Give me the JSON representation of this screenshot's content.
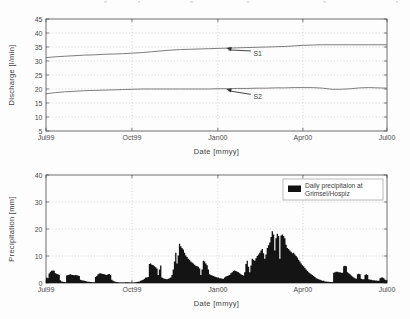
{
  "figure": {
    "title": "",
    "background": "#fdfdfd",
    "panels": [
      "discharge",
      "precipitation"
    ]
  },
  "colors": {
    "axis": "#4a4a4a",
    "grid": "#b9b9b9",
    "series": "#6e6e6e",
    "bars": "#141414",
    "text": "#3f3f3f",
    "background": "#fdfdfd"
  },
  "chart_data": [
    {
      "id": "discharge",
      "type": "line",
      "title": "",
      "xlabel": "Date  [mmyy]",
      "ylabel": "Discharge  [l/min]",
      "xlim": [
        0,
        365
      ],
      "ylim": [
        5,
        45
      ],
      "yticks": [
        5,
        10,
        15,
        20,
        25,
        30,
        35,
        40,
        45
      ],
      "ytick_labels": [
        "5",
        "10",
        "15",
        "20",
        "25",
        "30",
        "35",
        "40",
        "45"
      ],
      "xticks": [
        0,
        92,
        184,
        275,
        365
      ],
      "xtick_labels": [
        "Jul99",
        "Oct99",
        "Jan00",
        "Apr00",
        "Jul00"
      ],
      "grid": true,
      "grid_style": "dotted",
      "legend": "none",
      "annotations": [
        {
          "text": "S1",
          "x": 222,
          "y": 32.8,
          "points_to_x": 193,
          "points_to_y": 34.6
        },
        {
          "text": "S2",
          "x": 222,
          "y": 17.3,
          "points_to_x": 193,
          "points_to_y": 20.0
        }
      ],
      "series": [
        {
          "name": "S1",
          "x": [
            0,
            10,
            20,
            31,
            41,
            52,
            62,
            72,
            82,
            92,
            103,
            113,
            123,
            134,
            144,
            155,
            165,
            175,
            184,
            195,
            205,
            215,
            226,
            236,
            246,
            256,
            266,
            275,
            285,
            296,
            306,
            316,
            326,
            336,
            345,
            355,
            365
          ],
          "y": [
            31.2,
            31.5,
            31.7,
            31.9,
            32.1,
            32.2,
            32.4,
            32.5,
            32.6,
            32.8,
            33.0,
            33.3,
            33.6,
            33.9,
            34.1,
            34.2,
            34.3,
            34.4,
            34.5,
            34.6,
            34.7,
            34.8,
            34.9,
            35.0,
            35.1,
            35.2,
            35.4,
            35.6,
            35.7,
            35.8,
            35.8,
            35.8,
            35.8,
            35.8,
            35.8,
            35.8,
            35.8
          ]
        },
        {
          "name": "S2",
          "x": [
            0,
            10,
            20,
            31,
            41,
            52,
            62,
            72,
            82,
            92,
            103,
            113,
            123,
            134,
            144,
            155,
            165,
            175,
            184,
            195,
            205,
            215,
            226,
            236,
            246,
            256,
            266,
            275,
            285,
            296,
            306,
            316,
            326,
            336,
            345,
            355,
            365
          ],
          "y": [
            18.3,
            18.7,
            19.0,
            19.2,
            19.4,
            19.5,
            19.6,
            19.7,
            19.8,
            19.9,
            20.0,
            20.0,
            20.0,
            20.0,
            20.0,
            20.0,
            20.0,
            20.0,
            20.1,
            20.1,
            20.2,
            20.2,
            20.3,
            20.3,
            20.4,
            20.4,
            20.5,
            20.5,
            20.5,
            20.3,
            19.9,
            19.9,
            20.1,
            20.4,
            20.5,
            20.4,
            20.3
          ]
        }
      ]
    },
    {
      "id": "precipitation",
      "type": "bar",
      "title": "",
      "xlabel": "Date  [mmyy]",
      "ylabel": "Precipitation  [mm]",
      "xlim": [
        0,
        365
      ],
      "ylim": [
        0,
        40
      ],
      "yticks": [
        0,
        10,
        20,
        30,
        40
      ],
      "ytick_labels": [
        "0",
        "10",
        "20",
        "30",
        "40"
      ],
      "xticks": [
        0,
        92,
        184,
        275,
        365
      ],
      "xtick_labels": [
        "Jul99",
        "Oct99",
        "Jan00",
        "Apr00",
        "Jul00"
      ],
      "grid": true,
      "grid_style": "dotted",
      "legend": {
        "position": "top-right",
        "entries": [
          "Daily precipitaion at Grimsel/Hospiz"
        ]
      },
      "legend_line1": "Daily precipitaion at",
      "legend_line2": "Grimsel/Hospiz",
      "bar_width_days": 1,
      "categories_note": "daily values, Jul 1999 - Jul 2000",
      "values": [
        2.0,
        1.8,
        3.5,
        4.2,
        4.5,
        4.6,
        4.5,
        3.6,
        3.4,
        3.2,
        3.0,
        1.0,
        0.6,
        0.5,
        0.4,
        0.3,
        2.8,
        3.0,
        3.1,
        3.2,
        3.1,
        3.0,
        2.9,
        3.0,
        2.9,
        2.8,
        2.6,
        1.2,
        1.0,
        0.9,
        0.8,
        0.7,
        0.6,
        0.5,
        0.5,
        0.4,
        0.4,
        0.3,
        0.3,
        2.2,
        2.6,
        3.2,
        3.5,
        3.6,
        3.4,
        3.3,
        3.2,
        3.1,
        3.0,
        3.2,
        3.3,
        3.1,
        1.2,
        0.8,
        0.6,
        0.5,
        0.4,
        0.3,
        0.2,
        0.2,
        0.2,
        0.2,
        0.2,
        0.3,
        0.3,
        0.3,
        0.2,
        0.2,
        0.2,
        0.2,
        0.2,
        0.3,
        0.4,
        0.5,
        0.6,
        0.8,
        1.0,
        1.2,
        1.6,
        2.0,
        2.0,
        2.2,
        7.0,
        7.2,
        6.8,
        6.6,
        6.2,
        5.8,
        5.4,
        3.0,
        5.0,
        6.5,
        2.0,
        1.8,
        1.6,
        1.5,
        1.4,
        1.6,
        1.8,
        2.0,
        3.0,
        5.0,
        8.0,
        11.2,
        7.2,
        10.2,
        14.5,
        13.6,
        13.0,
        12.4,
        11.2,
        10.2,
        9.6,
        9.0,
        8.6,
        8.0,
        7.6,
        7.2,
        6.8,
        6.4,
        6.2,
        6.0,
        5.4,
        3.0,
        5.0,
        8.2,
        8.0,
        7.2,
        6.6,
        5.0,
        3.2,
        3.0,
        2.8,
        2.6,
        2.4,
        2.2,
        2.0,
        2.0,
        1.8,
        1.8,
        1.6,
        1.6,
        2.0,
        2.4,
        2.6,
        2.8,
        3.0,
        3.6,
        4.0,
        4.4,
        4.6,
        4.4,
        4.2,
        4.0,
        3.6,
        3.2,
        3.0,
        2.8,
        4.0,
        7.0,
        8.2,
        6.0,
        4.0,
        6.5,
        9.0,
        8.6,
        8.2,
        9.2,
        10.0,
        10.6,
        11.2,
        12.0,
        12.6,
        11.0,
        9.0,
        10.6,
        13.0,
        14.0,
        15.0,
        17.0,
        19.2,
        18.0,
        12.0,
        16.6,
        18.2,
        17.4,
        9.0,
        17.6,
        18.0,
        17.4,
        16.6,
        14.2,
        13.0,
        12.6,
        12.0,
        11.6,
        11.0,
        11.2,
        10.6,
        10.0,
        9.4,
        8.6,
        8.0,
        7.2,
        6.6,
        6.2,
        5.6,
        5.0,
        4.4,
        4.0,
        3.6,
        3.2,
        3.0,
        2.6,
        2.2,
        1.8,
        1.6,
        1.4,
        1.2,
        1.0,
        0.8,
        0.8,
        0.6,
        0.6,
        0.5,
        0.5,
        0.4,
        0.4,
        0.4,
        3.8,
        4.0,
        4.2,
        4.2,
        4.0,
        4.0,
        3.8,
        3.8,
        6.2,
        6.4,
        6.2,
        4.0,
        3.6,
        3.2,
        2.8,
        2.4,
        2.0,
        1.8,
        1.6,
        3.2,
        3.4,
        3.2,
        1.6,
        1.4,
        1.4,
        3.0,
        3.2,
        3.0,
        1.4,
        1.2,
        1.2,
        1.0,
        1.0,
        0.9,
        0.9,
        0.8,
        0.8,
        1.8,
        2.0,
        2.0,
        1.8,
        1.2,
        1.0
      ]
    }
  ]
}
